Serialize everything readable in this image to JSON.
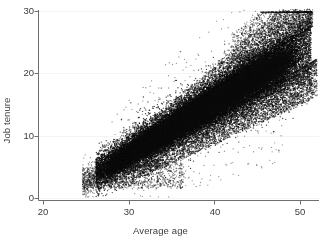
{
  "chart_data": {
    "type": "scatter",
    "title": "",
    "subtitle": "",
    "xlabel": "Average age",
    "ylabel": "Job tenure",
    "xlim": [
      18.5,
      52.0
    ],
    "ylim": [
      -0.3,
      30.5
    ],
    "xticks": [
      20,
      30,
      40,
      50
    ],
    "yticks": [
      0,
      10,
      20,
      30
    ],
    "xtick_labels": [
      "20",
      "30",
      "40",
      "50"
    ],
    "ytick_labels": [
      "0",
      "10",
      "20",
      "30"
    ],
    "grid": "horizontal-faint",
    "legend": "none",
    "annotations": [],
    "marker": {
      "shape": "circle",
      "color": "#0d0d0d",
      "size_px": 1.3,
      "opacity": 0.85
    },
    "n_points": 9000,
    "relationship": "strong positive linear",
    "fit_line": {
      "slope": 1.04,
      "intercept": -26.0,
      "note": "approximate ridge of the point cloud, not drawn"
    },
    "cloud_extent": {
      "x_min": 24.5,
      "x_max": 51.4,
      "y_min": 1.4,
      "y_max": 29.6
    },
    "band": {
      "x_start": 27.0,
      "x_end": 50.5,
      "y_at_x_start": 4.6,
      "y_at_x_end": 24.0,
      "half_width_at_start": 1.6,
      "half_width_at_end": 3.4
    },
    "series": [
      {
        "name": "workers",
        "x": [
          27.2,
          27.9,
          28.4,
          28.8,
          29.3,
          29.7,
          30.1,
          30.6,
          31.0,
          31.4,
          31.9,
          32.3,
          32.8,
          33.2,
          33.7,
          34.1,
          34.6,
          35.0,
          35.5,
          35.9,
          36.4,
          36.8,
          37.3,
          37.7,
          38.2,
          38.6,
          39.1,
          39.5,
          40.0,
          40.4,
          40.9,
          41.3,
          41.8,
          42.2,
          42.7,
          43.1,
          43.6,
          44.0,
          44.5,
          44.9,
          45.4,
          45.8,
          46.3,
          46.7,
          47.2,
          47.6,
          48.1,
          48.5,
          49.0,
          49.4,
          49.9,
          50.3
        ],
        "y": [
          4.7,
          4.9,
          5.1,
          5.3,
          5.6,
          5.8,
          6.1,
          6.4,
          6.7,
          7.0,
          7.4,
          7.7,
          8.1,
          8.4,
          8.8,
          9.2,
          9.5,
          9.9,
          10.3,
          10.7,
          11.1,
          11.5,
          11.9,
          12.3,
          12.7,
          13.1,
          13.5,
          13.9,
          14.3,
          14.8,
          15.2,
          15.6,
          16.1,
          16.5,
          17.0,
          17.4,
          17.9,
          18.3,
          18.8,
          19.2,
          19.7,
          20.1,
          20.6,
          21.0,
          21.5,
          21.9,
          22.4,
          22.8,
          23.2,
          23.6,
          24.0,
          24.4
        ]
      }
    ]
  },
  "axes": {
    "x_axis_name": "horizontal-axis",
    "y_axis_name": "vertical-axis"
  }
}
